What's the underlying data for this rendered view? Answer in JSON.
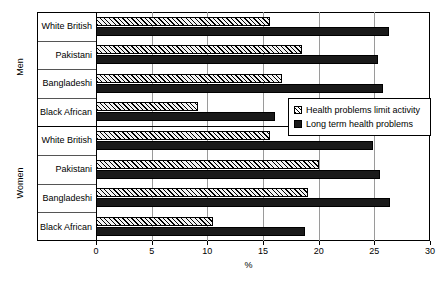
{
  "chart_data": {
    "type": "bar",
    "orientation": "horizontal",
    "title": "",
    "xlabel": "%",
    "ylabel": "",
    "xlim": [
      0,
      30
    ],
    "xticks": [
      0,
      5,
      10,
      15,
      20,
      25,
      30
    ],
    "grid": true,
    "legend_position": "inside-right",
    "panels": [
      {
        "name": "Men",
        "categories": [
          "White British",
          "Pakistani",
          "Bangladeshi",
          "Black African"
        ],
        "series": [
          {
            "name": "Health problems limit activity",
            "values": [
              15.6,
              18.5,
              16.7,
              9.2
            ]
          },
          {
            "name": "Long term health problems",
            "values": [
              26.3,
              25.3,
              25.8,
              16.1
            ]
          }
        ]
      },
      {
        "name": "Women",
        "categories": [
          "White British",
          "Pakistani",
          "Bangladeshi",
          "Black African"
        ],
        "series": [
          {
            "name": "Health problems limit activity",
            "values": [
              15.6,
              20.0,
              19.0,
              10.5
            ]
          },
          {
            "name": "Long term health problems",
            "values": [
              24.9,
              25.5,
              26.4,
              18.8
            ]
          }
        ]
      }
    ],
    "legend": [
      {
        "label": "Health problems limit activity",
        "pattern": "hatched"
      },
      {
        "label": "Long term health problems",
        "pattern": "solid"
      }
    ],
    "colors": {
      "solid_bar": "#1a1a1a",
      "hatch_line": "#000000",
      "hatch_background": "#f2f2f2",
      "gridline": "#9a9a9a",
      "frame": "#000000"
    }
  },
  "axis": {
    "tick_labels": [
      "0",
      "5",
      "10",
      "15",
      "20",
      "25",
      "30"
    ],
    "title": "%"
  },
  "panel_labels": {
    "men": "Men",
    "women": "Women"
  },
  "row_labels": {
    "men": [
      "White British",
      "Pakistani",
      "Bangladeshi",
      "Black African"
    ],
    "women": [
      "White British",
      "Pakistani",
      "Bangladeshi",
      "Black African"
    ]
  },
  "legend_labels": {
    "hatched": "Health problems limit activity",
    "solid": "Long term health problems"
  }
}
